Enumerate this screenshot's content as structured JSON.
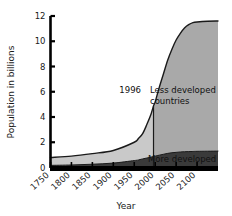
{
  "chart_data": {
    "type": "area",
    "title": "",
    "subtitle": "",
    "xlabel": "Year",
    "ylabel": "Population in billions",
    "xlim": [
      1750,
      2150
    ],
    "ylim": [
      0,
      12
    ],
    "grid": false,
    "legend_position": "inline-annotations",
    "x_ticks": [
      "1750",
      "1800",
      "1850",
      "1900",
      "1950",
      "2000",
      "2050",
      "2100"
    ],
    "x_tick_values": [
      1750,
      1800,
      1850,
      1900,
      1950,
      2000,
      2050,
      2100
    ],
    "y_ticks": [
      "0",
      "2",
      "4",
      "6",
      "8",
      "10",
      "12"
    ],
    "y_tick_values": [
      0,
      2,
      4,
      6,
      8,
      10,
      12
    ],
    "x": [
      1750,
      1800,
      1850,
      1900,
      1950,
      1960,
      1970,
      1980,
      1990,
      1996,
      2000,
      2010,
      2020,
      2030,
      2040,
      2050,
      2060,
      2070,
      2080,
      2090,
      2100,
      2125,
      2150
    ],
    "series": [
      {
        "name": "More developed countries",
        "stacked": true,
        "color": "#3a3a3a",
        "values": [
          0.17,
          0.2,
          0.26,
          0.35,
          0.55,
          0.6,
          0.68,
          0.75,
          0.82,
          0.88,
          0.9,
          0.98,
          1.05,
          1.12,
          1.17,
          1.2,
          1.23,
          1.25,
          1.26,
          1.27,
          1.28,
          1.29,
          1.3
        ]
      },
      {
        "name": "Less developed countries",
        "stacked": true,
        "color_before_1996": "#c9c9c9",
        "color_after_1996": "#a9a9a9",
        "values": [
          0.62,
          0.7,
          0.84,
          1.0,
          1.45,
          1.7,
          2.0,
          2.65,
          3.4,
          4.0,
          4.3,
          5.4,
          6.4,
          7.4,
          8.2,
          8.9,
          9.4,
          9.8,
          10.05,
          10.2,
          10.25,
          10.3,
          10.3
        ]
      }
    ],
    "total_values": [
      0.79,
      0.9,
      1.1,
      1.35,
      2.0,
      2.3,
      2.68,
      3.4,
      4.22,
      4.88,
      5.2,
      6.38,
      7.45,
      8.52,
      9.37,
      10.1,
      10.63,
      11.05,
      11.31,
      11.47,
      11.53,
      11.59,
      11.6
    ],
    "annotations": [
      {
        "id": "marker-year",
        "text": "1996",
        "x": 1996,
        "note": "vertical divider line at 1996"
      },
      {
        "id": "less-developed",
        "text_line1": "Less developed",
        "text_line2": "countries"
      },
      {
        "id": "more-developed",
        "text": "More developed"
      }
    ],
    "colors": {
      "axis": "#000000",
      "curve": "#1a1a1a",
      "less_developed_pre1996": "#c9c9c9",
      "less_developed_post1996": "#a9a9a9",
      "more_developed": "#3a3a3a",
      "background": "#ffffff"
    }
  }
}
